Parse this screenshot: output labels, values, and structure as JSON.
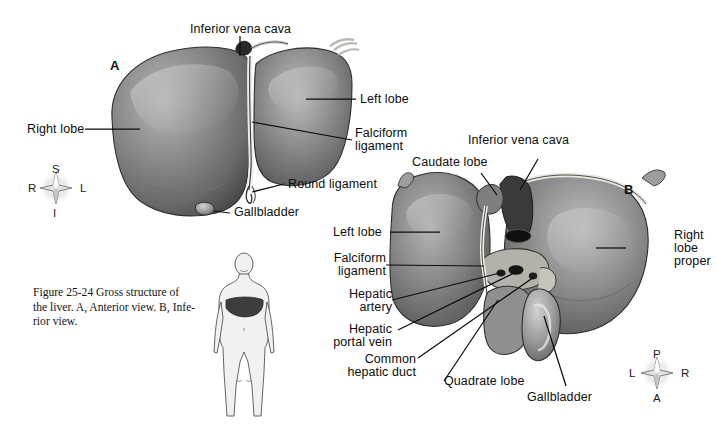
{
  "figure": {
    "caption_number": "Figure 25-24",
    "caption_text": "Gross structure of the liver. A, Anterior view. B, Inferior view.",
    "caption_line1": "Figure 25-24   Gross structure of",
    "caption_line2": "the liver. A, Anterior view. B, Infe-",
    "caption_line3": "rior view."
  },
  "panel_a": {
    "marker": "A",
    "view": "Anterior view",
    "labels": {
      "inferior_vena_cava": "Inferior vena cava",
      "right_lobe": "Right lobe",
      "left_lobe": "Left lobe",
      "falciform_ligament_l1": "Falciform",
      "falciform_ligament_l2": "ligament",
      "round_ligament": "Round ligament",
      "gallbladder": "Gallbladder"
    },
    "compass": {
      "top": "S",
      "left": "R",
      "right": "L",
      "bottom": "I"
    }
  },
  "panel_b": {
    "marker": "B",
    "view": "Inferior view",
    "labels": {
      "inferior_vena_cava": "Inferior vena cava",
      "caudate_lobe": "Caudate lobe",
      "left_lobe": "Left lobe",
      "falciform_ligament_l1": "Falciform",
      "falciform_ligament_l2": "ligament",
      "hepatic_artery_l1": "Hepatic",
      "hepatic_artery_l2": "artery",
      "hepatic_portal_vein_l1": "Hepatic",
      "hepatic_portal_vein_l2": "portal vein",
      "common_hepatic_duct_l1": "Common",
      "common_hepatic_duct_l2": "hepatic duct",
      "quadrate_lobe": "Quadrate lobe",
      "gallbladder": "Gallbladder",
      "right_lobe_proper_l1": "Right",
      "right_lobe_proper_l2": "lobe",
      "right_lobe_proper_l3": "proper"
    },
    "compass": {
      "top": "P",
      "left": "L",
      "right": "R",
      "bottom": "A"
    }
  },
  "orientation_figure": {
    "name": "human-body-liver-locator",
    "description": "Standing anterior human figure with liver shaded"
  },
  "colors": {
    "background": "#ffffff",
    "ink": "#0d0d0d",
    "liver_mid": "#8a8a8a",
    "liver_dark": "#4e4e4e",
    "liver_light": "#c9c9c9",
    "vessel": "#e6e3dc"
  }
}
